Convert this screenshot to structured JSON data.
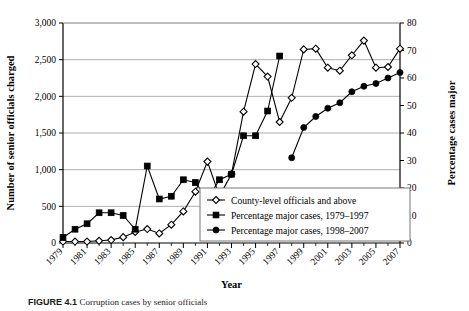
{
  "figure": {
    "caption_label": "FIGURE 4.1",
    "caption_text": "Corruption cases by senior officials"
  },
  "chart_data": {
    "type": "line",
    "title": "",
    "xlabel": "Year",
    "ylabel": "Number of senior officials charged",
    "y2label": "Percentage cases major",
    "grid": true,
    "legend_position": "bottom-right",
    "x": [
      1979,
      1980,
      1981,
      1982,
      1983,
      1984,
      1985,
      1986,
      1987,
      1988,
      1989,
      1990,
      1991,
      1992,
      1993,
      1994,
      1995,
      1996,
      1997,
      1998,
      1999,
      2000,
      2001,
      2002,
      2003,
      2004,
      2005,
      2006,
      2007
    ],
    "xtick_labels": [
      "1979",
      "1981",
      "1983",
      "1985",
      "1987",
      "1989",
      "1991",
      "1993",
      "1995",
      "1997",
      "1999",
      "2001",
      "2003",
      "2005",
      "2007"
    ],
    "xtick_years": [
      1979,
      1981,
      1983,
      1985,
      1987,
      1989,
      1991,
      1993,
      1995,
      1997,
      1999,
      2001,
      2003,
      2005,
      2007
    ],
    "ylim": [
      0,
      3000
    ],
    "ytick_labels": [
      "0",
      "500",
      "1,000",
      "1,500",
      "2,000",
      "2,500",
      "3,000"
    ],
    "ytick_values": [
      0,
      500,
      1000,
      1500,
      2000,
      2500,
      3000
    ],
    "y2lim": [
      0,
      80
    ],
    "y2tick_labels": [
      "0",
      "10",
      "20",
      "30",
      "40",
      "50",
      "60",
      "70",
      "80"
    ],
    "y2tick_values": [
      0,
      10,
      20,
      30,
      40,
      50,
      60,
      70,
      80
    ],
    "series": [
      {
        "name": "County-level officials and above",
        "marker": "open-diamond",
        "axis": "left",
        "x": [
          1979,
          1980,
          1981,
          1982,
          1983,
          1984,
          1985,
          1986,
          1987,
          1988,
          1989,
          1990,
          1991,
          1992,
          1993,
          1994,
          1995,
          1996,
          1997,
          1998,
          1999,
          2000,
          2001,
          2002,
          2003,
          2004,
          2005,
          2006,
          2007
        ],
        "values": [
          20,
          20,
          20,
          30,
          40,
          80,
          150,
          190,
          130,
          250,
          430,
          700,
          1110,
          640,
          940,
          1790,
          2440,
          2270,
          1650,
          1980,
          2640,
          2650,
          2390,
          2350,
          2560,
          2760,
          2390,
          2400,
          2650
        ]
      },
      {
        "name": "Percentage major cases, 1979–1997",
        "marker": "filled-square",
        "axis": "right",
        "x": [
          1979,
          1980,
          1981,
          1982,
          1983,
          1984,
          1985,
          1986,
          1987,
          1988,
          1989,
          1990,
          1991,
          1992,
          1993,
          1994,
          1995,
          1996,
          1997
        ],
        "values": [
          2,
          5,
          7,
          11,
          11,
          10,
          5,
          28,
          16,
          17,
          23,
          22,
          16,
          23,
          25,
          39,
          39,
          48,
          68
        ]
      },
      {
        "name": "Percentage major cases, 1998–2007",
        "marker": "filled-circle",
        "axis": "right",
        "x": [
          1998,
          1999,
          2000,
          2001,
          2002,
          2003,
          2004,
          2005,
          2006,
          2007
        ],
        "values": [
          31,
          42,
          46,
          49,
          51,
          55,
          57,
          58,
          60,
          62
        ]
      }
    ]
  },
  "legend": {
    "items": [
      {
        "label": "County-level officials and above",
        "marker": "open-diamond"
      },
      {
        "label": "Percentage major cases, 1979–1997",
        "marker": "filled-square"
      },
      {
        "label": "Percentage major cases, 1998–2007",
        "marker": "filled-circle"
      }
    ]
  }
}
